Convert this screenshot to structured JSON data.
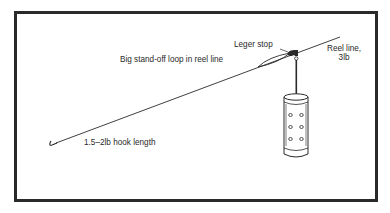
{
  "diagram": {
    "labels": {
      "leger_stop": "Leger stop",
      "loop": "Big stand-off loop in reel line",
      "reel_line_line1": "Reel line,",
      "reel_line_line2": "3lb",
      "hook_length": "1.5–2lb hook length"
    },
    "components": [
      "hook",
      "hook-length-line",
      "stand-off-loop",
      "leger-stop",
      "swivel",
      "feeder-link",
      "swimfeeder",
      "reel-line"
    ],
    "colors": {
      "ink": "#2a2a2a",
      "background": "#ffffff"
    }
  }
}
